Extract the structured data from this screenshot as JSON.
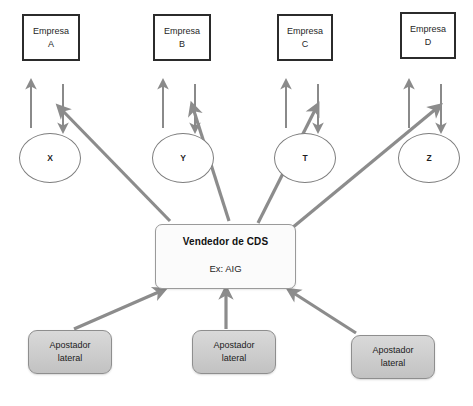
{
  "diagram": {
    "title_artifact": "",
    "colors": {
      "thin_arrow": "#8a8a8a",
      "thick_arrow": "#8c8c8c",
      "company_border": "#2b2b2b",
      "ellipse_border": "#7d7d7d",
      "cds_border": "#9a9a9a",
      "bettor_fill": "#cfcfcf",
      "background": "#ffffff"
    },
    "companies": [
      {
        "id": "A",
        "line1": "Empresa",
        "line2": "A",
        "x": 22,
        "y": 14,
        "w": 58,
        "h": 47
      },
      {
        "id": "B",
        "line1": "Empresa",
        "line2": "B",
        "x": 153,
        "y": 14,
        "w": 58,
        "h": 47
      },
      {
        "id": "C",
        "line1": "Empresa",
        "line2": "C",
        "x": 277,
        "y": 14,
        "w": 56,
        "h": 47
      },
      {
        "id": "D",
        "line1": "Empresa",
        "line2": "D",
        "x": 400,
        "y": 12,
        "w": 56,
        "h": 47
      }
    ],
    "nodes": [
      {
        "id": "X",
        "label": "X",
        "x": 19,
        "y": 133,
        "w": 62,
        "h": 50
      },
      {
        "id": "Y",
        "label": "Y",
        "x": 152,
        "y": 133,
        "w": 62,
        "h": 50
      },
      {
        "id": "T",
        "label": "T",
        "x": 274,
        "y": 133,
        "w": 62,
        "h": 50
      },
      {
        "id": "Z",
        "label": "Z",
        "x": 398,
        "y": 133,
        "w": 62,
        "h": 50
      }
    ],
    "center": {
      "title": "Vendedor de CDS",
      "subtitle": "Ex: AIG",
      "x": 155,
      "y": 224,
      "w": 141,
      "h": 65
    },
    "bettors": [
      {
        "line1": "Apostador",
        "line2": "lateral",
        "x": 28,
        "y": 330,
        "w": 84,
        "h": 44
      },
      {
        "line1": "Apostador",
        "line2": "lateral",
        "x": 192,
        "y": 330,
        "w": 84,
        "h": 44
      },
      {
        "line1": "Apostador",
        "line2": "lateral",
        "x": 351,
        "y": 335,
        "w": 84,
        "h": 44
      }
    ],
    "thin_arrow_pairs": [
      {
        "company": "A",
        "up_x": 31,
        "down_x": 63,
        "y_top": 84,
        "y_bottom": 128
      },
      {
        "company": "B",
        "up_x": 163,
        "down_x": 195,
        "y_top": 84,
        "y_bottom": 128
      },
      {
        "company": "C",
        "up_x": 286,
        "down_x": 318,
        "y_top": 84,
        "y_bottom": 128
      },
      {
        "company": "D",
        "up_x": 409,
        "down_x": 441,
        "y_top": 84,
        "y_bottom": 128
      }
    ],
    "thick_arrows_out": [
      {
        "from": "cds",
        "to": "X",
        "x1": 168,
        "y1": 220,
        "x2": 60,
        "y2": 108
      },
      {
        "from": "cds",
        "to": "Y",
        "x1": 228,
        "y1": 220,
        "x2": 192,
        "y2": 108
      },
      {
        "from": "cds",
        "to": "T",
        "x1": 258,
        "y1": 222,
        "x2": 315,
        "y2": 108
      },
      {
        "from": "cds",
        "to": "Z",
        "x1": 290,
        "y1": 226,
        "x2": 437,
        "y2": 108
      }
    ],
    "thick_arrows_in": [
      {
        "from": "bettor-left",
        "to": "cds",
        "x1": 74,
        "y1": 328,
        "x2": 160,
        "y2": 290
      },
      {
        "from": "bettor-middle",
        "to": "cds",
        "x1": 226,
        "y1": 328,
        "x2": 226,
        "y2": 291
      },
      {
        "from": "bettor-right",
        "to": "cds",
        "x1": 354,
        "y1": 332,
        "x2": 292,
        "y2": 291
      }
    ]
  }
}
